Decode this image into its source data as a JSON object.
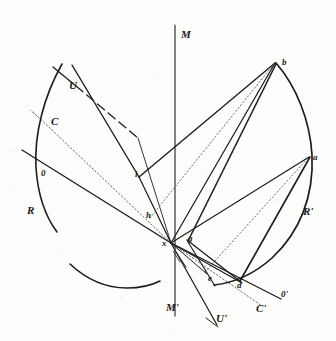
{
  "figure": {
    "background_color": "#fdfdfc",
    "ink_color": "#1a1a1a"
  },
  "axis": {
    "top_label": "M",
    "bottom_label": "M'"
  },
  "labels": {
    "u_left": "U",
    "c_left": "C",
    "o_left": "0",
    "r_left": "R",
    "i_point": "i",
    "h_point": "h",
    "x_point": "x",
    "g_point": "g",
    "b_point": "b",
    "a_point": "a",
    "r_right": "R'",
    "e_point": "e",
    "d_point": "d",
    "o_right": "0'",
    "c_right": "C'",
    "u_right": "U'"
  },
  "geometry": {
    "center_x": 171,
    "center_y": 243,
    "axis_x": 175,
    "axis_top_y": 25,
    "axis_bottom_y": 316
  },
  "arcs": [
    {
      "name": "left-arc-upper",
      "label": "R"
    },
    {
      "name": "left-arc-lower",
      "label": "R"
    },
    {
      "name": "right-arc",
      "label": "R'"
    }
  ],
  "rays": [
    {
      "name": "ray-x-to-b",
      "from": "x",
      "to": "b",
      "style": "solid"
    },
    {
      "name": "ray-x-to-a",
      "from": "x",
      "to": "a",
      "style": "solid"
    },
    {
      "name": "ray-g-to-b",
      "from": "g",
      "to": "b",
      "style": "solid"
    },
    {
      "name": "ray-g-to-a",
      "from": "g",
      "to": "a",
      "style": "solid"
    },
    {
      "name": "ray-h-to-b",
      "from": "h",
      "to": "b",
      "style": "dashed"
    },
    {
      "name": "ray-e-to-a",
      "from": "e",
      "to": "a",
      "style": "dashed"
    },
    {
      "name": "ray-d-to-b",
      "from": "d",
      "to": "b",
      "style": "solid"
    },
    {
      "name": "ray-o-to-oprime",
      "from": "0",
      "to": "0'",
      "style": "solid"
    },
    {
      "name": "ray-c-to-cprime",
      "from": "C",
      "to": "C'",
      "style": "dashed"
    },
    {
      "name": "ray-u-to-uprime",
      "from": "U",
      "to": "U'",
      "style": "solid"
    },
    {
      "name": "ray-u-to-i",
      "from": "U",
      "to": "i",
      "style": "dashed"
    },
    {
      "name": "ray-i-to-x",
      "from": "i",
      "to": "x",
      "style": "solid"
    }
  ]
}
